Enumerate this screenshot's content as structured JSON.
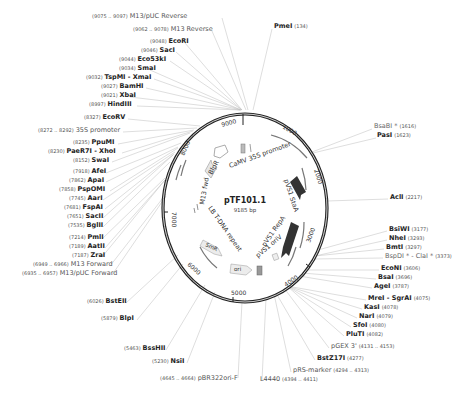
{
  "plasmid": {
    "name": "pTF101.1",
    "length_label": "9185 bp",
    "ticks": [
      "1000",
      "2000",
      "3000",
      "4000",
      "5000",
      "6000",
      "7000",
      "8000",
      "9000"
    ]
  },
  "left_labels": [
    {
      "pos": "(9075 .. 9097)",
      "name": "M13/pUC Reverse",
      "kind": "feat",
      "x": 92,
      "y": 16
    },
    {
      "pos": "(9062 .. 9078)",
      "name": "M13 Reverse",
      "kind": "feat",
      "x": 133,
      "y": 29
    },
    {
      "pos": "(9048)",
      "name": "EcoRI",
      "kind": "site",
      "x": 150,
      "y": 41
    },
    {
      "pos": "(9046)",
      "name": "SacI",
      "kind": "site",
      "x": 141,
      "y": 50
    },
    {
      "pos": "(9044)",
      "name": "Eco53kI",
      "kind": "site",
      "x": 119,
      "y": 59
    },
    {
      "pos": "(9034)",
      "name": "SmaI",
      "kind": "site",
      "x": 119,
      "y": 68
    },
    {
      "pos": "(9032)",
      "name": "TspMI - XmaI",
      "kind": "site",
      "x": 86,
      "y": 77
    },
    {
      "pos": "(9027)",
      "name": "BamHI",
      "kind": "site",
      "x": 101,
      "y": 86
    },
    {
      "pos": "(9021)",
      "name": "XbaI",
      "kind": "site",
      "x": 101,
      "y": 95
    },
    {
      "pos": "(8997)",
      "name": "HindIII",
      "kind": "site",
      "x": 89,
      "y": 104
    },
    {
      "pos": "(8327)",
      "name": "EcoRV",
      "kind": "site",
      "x": 84,
      "y": 117
    },
    {
      "pos": "(8272 .. 8292)",
      "name": "35S promoter",
      "kind": "feat",
      "x": 38,
      "y": 130
    },
    {
      "pos": "(8235)",
      "name": "PpuMI",
      "kind": "site",
      "x": 73,
      "y": 142
    },
    {
      "pos": "(8230)",
      "name": "PaeR7I - XhoI",
      "kind": "site",
      "x": 48,
      "y": 151
    },
    {
      "pos": "(8152)",
      "name": "SwaI",
      "kind": "site",
      "x": 73,
      "y": 160
    },
    {
      "pos": "(7918)",
      "name": "AfeI",
      "kind": "site",
      "x": 73,
      "y": 171
    },
    {
      "pos": "(7862)",
      "name": "ApaI",
      "kind": "site",
      "x": 69,
      "y": 180
    },
    {
      "pos": "(7858)",
      "name": "PspOMI",
      "kind": "site",
      "x": 59,
      "y": 189
    },
    {
      "pos": "(7745)",
      "name": "AarI",
      "kind": "site",
      "x": 69,
      "y": 198
    },
    {
      "pos": "(7681)",
      "name": "FspAI",
      "kind": "site",
      "x": 64,
      "y": 207
    },
    {
      "pos": "(7651)",
      "name": "SacII",
      "kind": "site",
      "x": 67,
      "y": 216
    },
    {
      "pos": "(7535)",
      "name": "BglII",
      "kind": "site",
      "x": 68,
      "y": 225
    },
    {
      "pos": "(7214)",
      "name": "PmlI",
      "kind": "site",
      "x": 69,
      "y": 237
    },
    {
      "pos": "(7189)",
      "name": "AatII",
      "kind": "site",
      "x": 69,
      "y": 246
    },
    {
      "pos": "(7187)",
      "name": "ZraI",
      "kind": "site",
      "x": 72,
      "y": 255
    },
    {
      "pos": "(6949 .. 6966)",
      "name": "M13 Forward",
      "kind": "feat",
      "x": 33,
      "y": 264
    },
    {
      "pos": "(6935 .. 6957)",
      "name": "M13/pUC Forward",
      "kind": "feat",
      "x": 22,
      "y": 273
    },
    {
      "pos": "(6026)",
      "name": "BstEII",
      "kind": "site",
      "x": 87,
      "y": 301
    },
    {
      "pos": "(5879)",
      "name": "BlpI",
      "kind": "site",
      "x": 101,
      "y": 318
    },
    {
      "pos": "(5463)",
      "name": "BssHII",
      "kind": "site",
      "x": 124,
      "y": 348
    },
    {
      "pos": "(5230)",
      "name": "NsiI",
      "kind": "site",
      "x": 152,
      "y": 361
    },
    {
      "pos": "(4645 .. 4664)",
      "name": "pBR322ori-F",
      "kind": "feat",
      "x": 160,
      "y": 378
    }
  ],
  "right_labels": [
    {
      "name": "PmeI",
      "pos": "(134)",
      "kind": "site",
      "x": 274,
      "y": 26
    },
    {
      "name": "BsaBI *",
      "pos": "(1616)",
      "kind": "star",
      "x": 374,
      "y": 126
    },
    {
      "name": "PasI",
      "pos": "(1623)",
      "kind": "site",
      "x": 377,
      "y": 135
    },
    {
      "name": "AclI",
      "pos": "(2217)",
      "kind": "site",
      "x": 390,
      "y": 197
    },
    {
      "name": "BsiWI",
      "pos": "(3177)",
      "kind": "site",
      "x": 389,
      "y": 229
    },
    {
      "name": "NheI",
      "pos": "(3293)",
      "kind": "site",
      "x": 389,
      "y": 238
    },
    {
      "name": "BmtI",
      "pos": "(3297)",
      "kind": "site",
      "x": 386,
      "y": 247
    },
    {
      "name": "BspDI * - ClaI *",
      "pos": "(3373)",
      "kind": "star",
      "x": 385,
      "y": 256
    },
    {
      "name": "EcoNI",
      "pos": "(3606)",
      "kind": "site",
      "x": 381,
      "y": 268
    },
    {
      "name": "BsaI",
      "pos": "(3696)",
      "kind": "site",
      "x": 378,
      "y": 277
    },
    {
      "name": "AgeI",
      "pos": "(3787)",
      "kind": "site",
      "x": 374,
      "y": 286
    },
    {
      "name": "MreI - SgrAI",
      "pos": "(4075)",
      "kind": "site",
      "x": 368,
      "y": 298
    },
    {
      "name": "KasI",
      "pos": "(4078)",
      "kind": "site",
      "x": 364,
      "y": 307
    },
    {
      "name": "NarI",
      "pos": "(4079)",
      "kind": "site",
      "x": 359,
      "y": 316
    },
    {
      "name": "SfoI",
      "pos": "(4080)",
      "kind": "site",
      "x": 353,
      "y": 325
    },
    {
      "name": "PluTI",
      "pos": "(4082)",
      "kind": "site",
      "x": 346,
      "y": 334
    },
    {
      "name": "pGEX 3'",
      "pos": "(4131 .. 4153)",
      "kind": "feat",
      "x": 331,
      "y": 346
    },
    {
      "name": "BstZ17I",
      "pos": "(4277)",
      "kind": "site",
      "x": 317,
      "y": 358
    },
    {
      "name": "pRS-marker",
      "pos": "(4294 .. 4313)",
      "kind": "feat",
      "x": 293,
      "y": 370
    },
    {
      "name": "L4440",
      "pos": "(4394 .. 4411)",
      "kind": "feat",
      "x": 260,
      "y": 379
    }
  ],
  "features": {
    "camv_35s_promoter": "CaMV 35S promoter",
    "bar": "BlpR",
    "m13_fwd": "M13 fwd",
    "lb_tdna": "LB T-DNA repeat",
    "smr": "SmR",
    "ori": "ori",
    "pvs1_sta": "pVS1 StaA",
    "pvs1_repa": "pVS1 RepA",
    "pvs1_oriv": "pVS1 oriV"
  },
  "colors": {
    "backbone": "#222222",
    "leader": "#bbbbbb",
    "feature_fill": "#e6e6e6",
    "feature_dark": "#333333"
  }
}
